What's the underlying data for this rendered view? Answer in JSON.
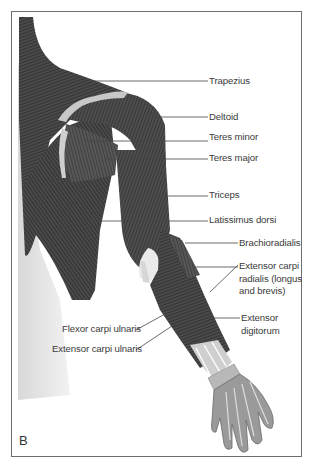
{
  "figure": {
    "panel_letter": "B",
    "colors": {
      "muscle_dark": "#3a3a3a",
      "muscle_mid": "#555555",
      "tendon": "#c8c8c8",
      "skin": "#e6e6e6",
      "hand": "#9a9a9a",
      "frame": "#6e6e6e",
      "leader_line": "#444444"
    },
    "labels": [
      {
        "id": "trapezius",
        "text": "Trapezius"
      },
      {
        "id": "deltoid",
        "text": "Deltoid"
      },
      {
        "id": "teres-minor",
        "text": "Teres minor"
      },
      {
        "id": "teres-major",
        "text": "Teres major"
      },
      {
        "id": "triceps",
        "text": "Triceps"
      },
      {
        "id": "latissimus-dorsi",
        "text": "Latissimus dorsi"
      },
      {
        "id": "brachioradialis",
        "text": "Brachioradialis"
      },
      {
        "id": "extensor-carpi-radialis",
        "text": "Extensor carpi\nradialis (longus\nand brevis)"
      },
      {
        "id": "extensor-digitorum",
        "text": "Extensor\ndigitorum"
      },
      {
        "id": "flexor-carpi-ulnaris",
        "text": "Flexor carpi ulnaris"
      },
      {
        "id": "extensor-carpi-ulnaris",
        "text": "Extensor carpi ulnaris"
      }
    ]
  }
}
